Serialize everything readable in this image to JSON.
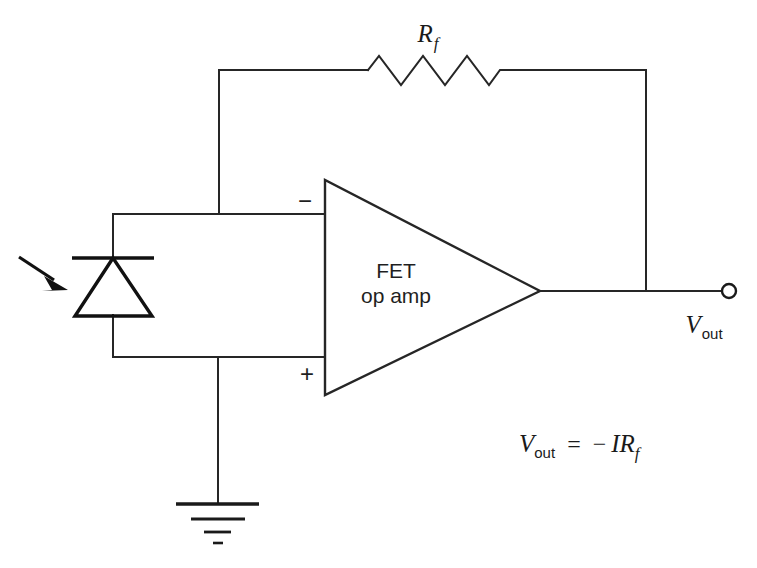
{
  "figure": {
    "kind": "circuit-schematic",
    "title_text": "",
    "background_color": "#ffffff",
    "line_color": "#262626"
  },
  "components": {
    "feedback_resistor": {
      "label": "R",
      "label_subscript": "f",
      "name": "feedback-resistor",
      "zigzag_peaks": 6
    },
    "opamp": {
      "label_line1": "FET",
      "label_line2": "op amp",
      "inverting_sign": "−",
      "noninverting_sign": "+",
      "name": "fet-op-amp"
    },
    "photodiode": {
      "name": "photodiode",
      "incident_light_arrow": "light-arrow"
    },
    "ground": {
      "name": "ground-symbol",
      "bar_count": 4
    },
    "output_terminal": {
      "name": "output-terminal",
      "label": "V",
      "label_subscript": "out"
    }
  },
  "equation": {
    "lhs_var": "V",
    "lhs_sub": "out",
    "equals": "=",
    "minus": "−",
    "current": "I",
    "resistor": "R",
    "resistor_sub": "f",
    "full_text": "Vout = −IRf"
  }
}
